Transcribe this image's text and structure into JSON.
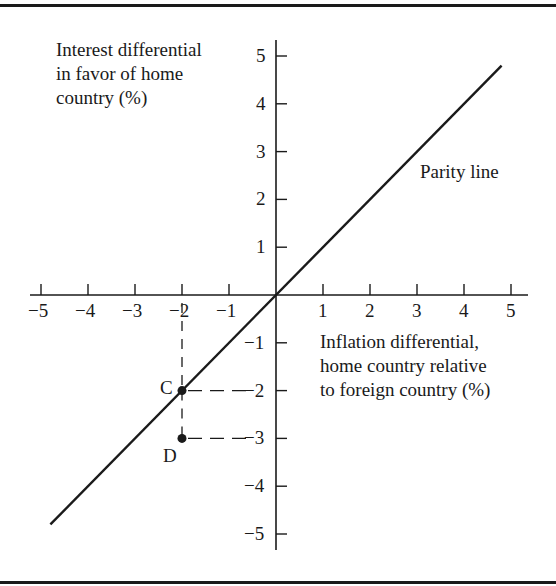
{
  "chart_data": {
    "type": "line",
    "title": "",
    "xlabel": "Inflation differential, home country relative to foreign country (%)",
    "ylabel": "Interest differential in favor of home country (%)",
    "xlabel_lines": [
      "Inflation differential,",
      "home country relative",
      "to foreign country (%)"
    ],
    "ylabel_lines": [
      "Interest differential",
      "in favor of home",
      "country (%)"
    ],
    "xlim": [
      -5.3,
      5.5
    ],
    "ylim": [
      -5.3,
      5.3
    ],
    "x_ticks": [
      -5,
      -4,
      -3,
      -2,
      -1,
      1,
      2,
      3,
      4,
      5
    ],
    "y_ticks": [
      5,
      4,
      3,
      2,
      1,
      -1,
      -2,
      -3,
      -4,
      -5
    ],
    "x_tick_labels": [
      "−5",
      "−4",
      "−3",
      "−2",
      "−1",
      "1",
      "2",
      "3",
      "4",
      "5"
    ],
    "y_tick_labels": [
      "5",
      "4",
      "3",
      "2",
      "1",
      "−1",
      "−2",
      "−3",
      "−4",
      "−5"
    ],
    "grid": false,
    "series": [
      {
        "name": "Parity line",
        "x": [
          -4.8,
          4.8
        ],
        "y": [
          -4.8,
          4.8
        ]
      }
    ],
    "points": [
      {
        "label": "C",
        "x": -2,
        "y": -2
      },
      {
        "label": "D",
        "x": -2,
        "y": -3
      }
    ],
    "annotations": [
      {
        "text": "Parity line",
        "x": 3.5,
        "y": 2.6
      },
      {
        "text": "dashed guide from C and D down/up to x = -2 and across to y-axis",
        "x": -2,
        "y": -2.5
      }
    ]
  },
  "labels": {
    "parity": "Parity line",
    "point_c": "C",
    "point_d": "D"
  }
}
